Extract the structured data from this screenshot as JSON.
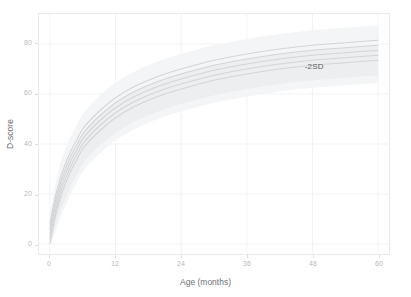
{
  "chart_data": {
    "type": "line",
    "title": "",
    "subtitle": "",
    "xlabel": "Age (months)",
    "ylabel": "D-score",
    "xlim": [
      -2,
      62
    ],
    "ylim": [
      -4,
      92
    ],
    "xticks": [
      0,
      12,
      24,
      36,
      48,
      60
    ],
    "xtick_labels": [
      "0",
      "12",
      "24",
      "36",
      "48",
      "60"
    ],
    "yticks": [
      0,
      20,
      40,
      60,
      80
    ],
    "ytick_labels": [
      "0",
      "20",
      "40",
      "60",
      "80"
    ],
    "grid": true,
    "legend": "none",
    "annotations": [
      {
        "text": "-2SD",
        "x": 46.5,
        "y": 70.5
      }
    ],
    "colors": {
      "background": "#ffffff",
      "panel": "#ffffff",
      "panel_border": "#e9eaec",
      "gridline": "#f2f3f5",
      "curve": "#d3d5d8",
      "band_outer": "#f4f5f6",
      "band_inner": "#eceeef",
      "tick_text": "#b9bbbe",
      "axis_title": "#6f7276",
      "annotation": "#5d6064"
    },
    "x": [
      0,
      0.5,
      1,
      2,
      3,
      4,
      5,
      6,
      8,
      10,
      12,
      15,
      18,
      21,
      24,
      30,
      36,
      42,
      48,
      54,
      60
    ],
    "series": [
      {
        "name": "+2SD",
        "label": "+2SD",
        "values": [
          8,
          14,
          19,
          27,
          33,
          38,
          42,
          46,
          51,
          55,
          58.5,
          62.5,
          65.5,
          68,
          70,
          73.5,
          76,
          78,
          79.5,
          80.5,
          81.5
        ]
      },
      {
        "name": "+1SD",
        "label": "+1SD",
        "values": [
          6,
          12,
          17,
          25,
          31,
          36,
          40,
          44,
          49,
          53,
          56.5,
          60.5,
          63.5,
          66,
          68,
          71.5,
          74,
          76,
          77.5,
          78.5,
          79.5
        ]
      },
      {
        "name": "median",
        "label": "0SD",
        "values": [
          4,
          10,
          15,
          23,
          29,
          34,
          38,
          42,
          47,
          51,
          54.5,
          58.5,
          61.5,
          64,
          66,
          69.5,
          72,
          74,
          75.5,
          76.5,
          77.5
        ]
      },
      {
        "name": "-1SD",
        "label": "-1SD",
        "values": [
          2,
          8,
          13,
          21,
          27,
          32,
          36,
          40,
          45,
          49,
          52.5,
          56.5,
          59.5,
          62,
          64,
          67.5,
          70,
          72,
          73.5,
          74.5,
          75.5
        ]
      },
      {
        "name": "-2SD",
        "label": "-2SD",
        "values": [
          0,
          6,
          11,
          19,
          25,
          30,
          34,
          38,
          43,
          47,
          50.5,
          54.5,
          57.5,
          60,
          62,
          65.5,
          68,
          70,
          71.5,
          72.5,
          73.5
        ]
      }
    ],
    "bands": [
      {
        "name": "outer-reference-band",
        "upper": [
          12,
          18,
          24,
          33,
          39,
          44,
          48,
          52,
          57,
          61,
          64.5,
          68.5,
          71.5,
          74,
          76,
          79.5,
          82,
          84,
          85.5,
          86.5,
          87.5
        ],
        "lower": [
          0,
          2,
          5,
          11,
          16,
          21,
          25,
          29,
          34,
          38,
          41.5,
          45.5,
          48.5,
          51,
          53,
          56.5,
          59,
          61,
          62.5,
          63.5,
          64.5
        ]
      },
      {
        "name": "inner-reference-band",
        "upper": [
          6,
          12,
          17,
          25,
          31,
          36,
          40,
          44,
          49,
          53,
          56.5,
          60.5,
          63.5,
          66,
          68,
          71.5,
          74,
          76,
          77.5,
          78.5,
          79.5
        ],
        "lower": [
          0,
          3,
          7,
          14,
          19,
          24,
          28,
          32,
          37,
          41,
          44.5,
          48.5,
          51.5,
          54,
          56,
          59.5,
          62,
          64,
          65.5,
          66.5,
          67.5
        ]
      }
    ]
  }
}
